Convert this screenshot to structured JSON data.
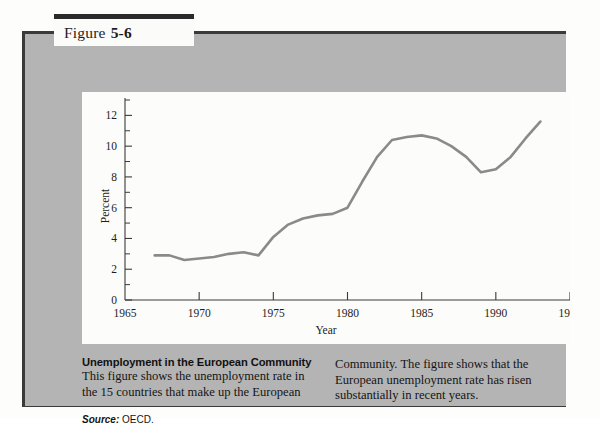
{
  "figure": {
    "label_word": "Figure",
    "label_number": "5-6"
  },
  "caption": {
    "title": "Unemployment in the European Community",
    "left_text": "This figure shows the unemployment rate in the 15 countries that make up the European",
    "right_text": "Community. The figure shows that the European unemployment rate has risen substantially in recent years.",
    "source_word": "Source:",
    "source_value": "OECD."
  },
  "chart_data": {
    "type": "line",
    "title": "",
    "xlabel": "Year",
    "ylabel": "Percent",
    "xlim": [
      1965,
      1995
    ],
    "ylim": [
      0,
      13
    ],
    "xticks": [
      1965,
      1970,
      1975,
      1980,
      1985,
      1990,
      1995
    ],
    "xtick_labels": [
      "1965",
      "1970",
      "1975",
      "1980",
      "1985",
      "1990",
      "1995"
    ],
    "yticks": [
      0,
      2,
      4,
      6,
      8,
      10,
      12
    ],
    "ytick_labels": [
      "0",
      "2",
      "4",
      "6",
      "8",
      "10",
      "12"
    ],
    "yticks_minor": [
      1,
      3,
      5,
      7,
      9,
      11,
      13
    ],
    "grid": false,
    "legend": null,
    "line_color": "#8a8a8a",
    "series": [
      {
        "name": "Unemployment rate",
        "x": [
          1967,
          1968,
          1969,
          1970,
          1971,
          1972,
          1973,
          1974,
          1975,
          1976,
          1977,
          1978,
          1979,
          1980,
          1981,
          1982,
          1983,
          1984,
          1985,
          1986,
          1987,
          1988,
          1989,
          1990,
          1991,
          1992,
          1993
        ],
        "values": [
          2.9,
          2.9,
          2.6,
          2.7,
          2.8,
          3.0,
          3.1,
          2.9,
          4.1,
          4.9,
          5.3,
          5.5,
          5.6,
          6.0,
          7.7,
          9.3,
          10.4,
          10.6,
          10.7,
          10.5,
          10.0,
          9.3,
          8.3,
          8.5,
          9.3,
          10.5,
          11.6
        ]
      }
    ]
  }
}
